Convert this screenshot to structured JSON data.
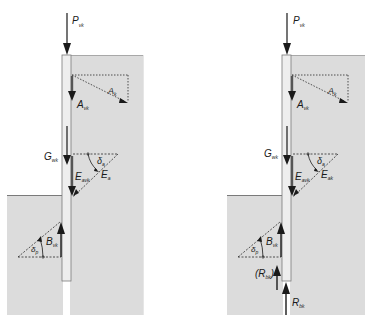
{
  "colors": {
    "soil": "#dcdcdc",
    "soil_edge": "#a8a8a8",
    "pile_fill": "#eeeeee",
    "pile_edge": "#7a7a7a",
    "arrow": "#1a1a1a",
    "dotted": "#2a2a2a"
  },
  "left_diagram": {
    "labels": {
      "P": "P",
      "P_sub": "vk",
      "A_v": "A",
      "A_v_sub": "vk",
      "A": "A",
      "A_sub": "k",
      "G": "G",
      "G_sub": "wk",
      "E_av": "E",
      "E_av_sub": "avk",
      "E_a": "E",
      "E_a_sub": "a",
      "delta_a": "δ",
      "delta_a_sub": "a",
      "B": "B",
      "B_sub": "vk",
      "delta_p": "δ",
      "delta_p_sub": "p"
    }
  },
  "right_diagram": {
    "labels": {
      "P": "P",
      "P_sub": "vk",
      "A_v": "A",
      "A_v_sub": "vk",
      "A": "A",
      "A_sub": "k",
      "G": "G",
      "G_sub": "wk",
      "E_av": "E",
      "E_av_sub": "avk",
      "E_a": "E",
      "E_a_sub": "ak",
      "delta_a": "δ",
      "delta_a_sub": "a",
      "B": "B",
      "B_sub": "vk",
      "delta_p": "δ",
      "delta_p_sub": "p",
      "R_paren_open": "(R",
      "R_paren_sub": "bk",
      "R_paren_close": ")",
      "R": "R",
      "R_sub": "bk"
    }
  }
}
